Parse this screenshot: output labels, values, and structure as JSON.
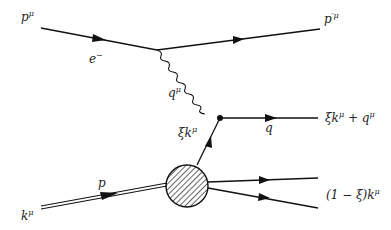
{
  "diagram": {
    "type": "feynman",
    "labels": {
      "incoming_electron": {
        "base": "p",
        "sup": "μ"
      },
      "electron_line": {
        "base": "e",
        "sup": "−"
      },
      "outgoing_electron": {
        "base": "p",
        "sup": "′μ"
      },
      "photon": {
        "base": "q",
        "sup": "μ"
      },
      "parton": {
        "pre": "ξ",
        "base": "k",
        "sup": "μ"
      },
      "quark_line": {
        "base": "q"
      },
      "outgoing_quark": {
        "text": "ξk",
        "sup": "μ",
        "post": " + q",
        "post_sup": "μ"
      },
      "proton_line": {
        "base": "p"
      },
      "incoming_proton": {
        "base": "k",
        "sup": "μ"
      },
      "remnant": {
        "text": "(1 − ξ)k",
        "sup": "μ"
      }
    },
    "colors": {
      "line": "#111111",
      "label": "#222222",
      "background": "#ffffff"
    }
  }
}
